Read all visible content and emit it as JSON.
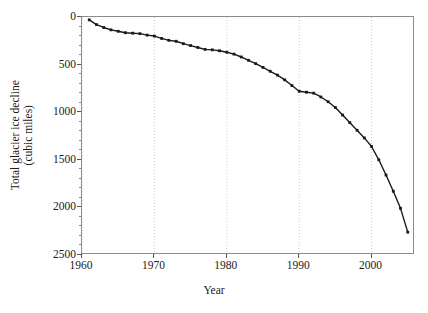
{
  "chart_data": {
    "type": "line",
    "title": "",
    "xlabel": "Year",
    "ylabel": "Total glacier ice decline (cubic miles)",
    "ylabel_line1": "Total glacier ice decline",
    "ylabel_line2": "(cubic miles)",
    "xlim": [
      1960,
      2006
    ],
    "ylim": [
      0,
      2500
    ],
    "y_inverted": true,
    "xticks": [
      1960,
      1970,
      1980,
      1990,
      2000
    ],
    "xtick_labels": [
      "1960",
      "1970",
      "1980",
      "1990",
      "2000"
    ],
    "yticks": [
      0,
      500,
      1000,
      1500,
      2000,
      2500
    ],
    "ytick_labels": [
      "0",
      "500",
      "1000",
      "1500",
      "2000",
      "2500"
    ],
    "grid": "vertical dotted gridlines at x major ticks",
    "grid_color": "#cccccc",
    "line_color": "#1a1a1a",
    "marker": "filled square",
    "marker_color": "#1a1a1a",
    "frame": "full box",
    "frame_color": "#8c8c8c",
    "series": [
      {
        "name": "Total glacier ice decline",
        "x": [
          1961,
          1962,
          1963,
          1964,
          1965,
          1966,
          1967,
          1968,
          1969,
          1970,
          1971,
          1972,
          1973,
          1974,
          1975,
          1976,
          1977,
          1978,
          1979,
          1980,
          1981,
          1982,
          1983,
          1984,
          1985,
          1986,
          1987,
          1988,
          1989,
          1990,
          1991,
          1992,
          1993,
          1994,
          1995,
          1996,
          1997,
          1998,
          1999,
          2000,
          2001,
          2002,
          2003,
          2004,
          2005
        ],
        "values": [
          30,
          80,
          110,
          135,
          150,
          165,
          170,
          175,
          190,
          200,
          225,
          245,
          255,
          280,
          300,
          320,
          340,
          345,
          355,
          370,
          390,
          420,
          455,
          490,
          530,
          570,
          610,
          660,
          720,
          780,
          790,
          800,
          840,
          890,
          950,
          1030,
          1110,
          1190,
          1270,
          1360,
          1500,
          1660,
          1830,
          2010,
          2260
        ]
      }
    ]
  }
}
